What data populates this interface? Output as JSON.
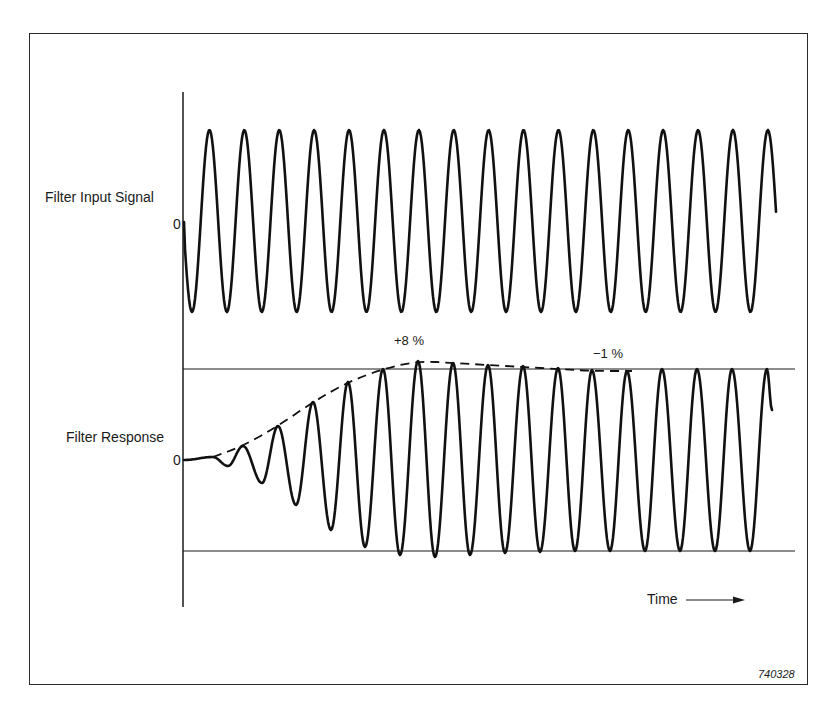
{
  "figure": {
    "figure_number": "740328",
    "x_axis_label": "Time",
    "input_label": "Filter Input Signal",
    "response_label": "Filter Response",
    "input_zero_label": "0",
    "response_zero_label": "0",
    "overshoot_label": "+8 %",
    "undershoot_label": "−1 %"
  },
  "chart_data": {
    "type": "line",
    "title": "",
    "xlabel": "Time",
    "ylabel": "",
    "series": [
      {
        "name": "Filter Input Signal",
        "kind": "sine-burst",
        "cycles": 17,
        "amplitude": 1.0,
        "start_phase": "starts at 0, goes negative first",
        "x_start_px": 184,
        "x_end_px": 776,
        "zero_y_px": 222,
        "peak_y_px": 130,
        "trough_y_px": 312,
        "period_px": 34.9,
        "first_trough_x_px": 192,
        "end_y_px": 177
      },
      {
        "name": "Filter Response",
        "kind": "growing-sine",
        "zero_y_px": 460,
        "steady_peak_y_px": 369,
        "steady_trough_y_px": 551,
        "period_px": 34.9,
        "start_flat_until_x_px": 213,
        "peaks": [
          [
            243,
            446
          ],
          [
            278,
            426
          ],
          [
            313,
            402
          ],
          [
            348,
            382
          ],
          [
            383,
            369
          ],
          [
            418,
            361
          ],
          [
            453,
            363
          ],
          [
            488,
            365
          ],
          [
            523,
            366
          ],
          [
            558,
            368
          ],
          [
            592,
            370
          ],
          [
            627,
            371
          ],
          [
            662,
            369
          ],
          [
            697,
            369
          ],
          [
            732,
            369
          ],
          [
            767,
            369
          ]
        ],
        "troughs": [
          [
            228,
            466
          ],
          [
            262,
            483
          ],
          [
            296,
            505
          ],
          [
            331,
            530
          ],
          [
            365,
            547
          ],
          [
            400,
            555
          ],
          [
            435,
            557
          ],
          [
            470,
            555
          ],
          [
            505,
            553
          ],
          [
            540,
            552
          ],
          [
            575,
            551
          ],
          [
            610,
            551
          ],
          [
            645,
            551
          ],
          [
            680,
            551
          ],
          [
            715,
            551
          ],
          [
            750,
            551
          ]
        ],
        "end": [
          772,
          410
        ]
      },
      {
        "name": "Envelope (dashed)",
        "kind": "dashed",
        "points": [
          [
            213,
            457
          ],
          [
            243,
            446
          ],
          [
            278,
            426
          ],
          [
            313,
            402
          ],
          [
            348,
            382
          ],
          [
            383,
            369
          ],
          [
            418,
            361
          ],
          [
            453,
            363
          ],
          [
            488,
            365
          ],
          [
            523,
            367
          ],
          [
            558,
            369
          ],
          [
            592,
            371
          ],
          [
            632,
            371
          ]
        ]
      }
    ],
    "reference_lines": [
      {
        "name": "steady-state upper amplitude",
        "y_px": 369,
        "x_from_px": 183,
        "x_to_px": 795
      },
      {
        "name": "steady-state lower amplitude",
        "y_px": 551,
        "x_from_px": 183,
        "x_to_px": 795
      }
    ],
    "annotations": [
      {
        "text": "+8 %",
        "meaning": "maximum overshoot of envelope"
      },
      {
        "text": "−1 %",
        "meaning": "undershoot of envelope before settling"
      }
    ],
    "axis": {
      "x_px": 183,
      "y_top_px": 92,
      "y_bottom_px": 607
    },
    "grid": false,
    "legend": "none (labels placed left of traces)"
  }
}
